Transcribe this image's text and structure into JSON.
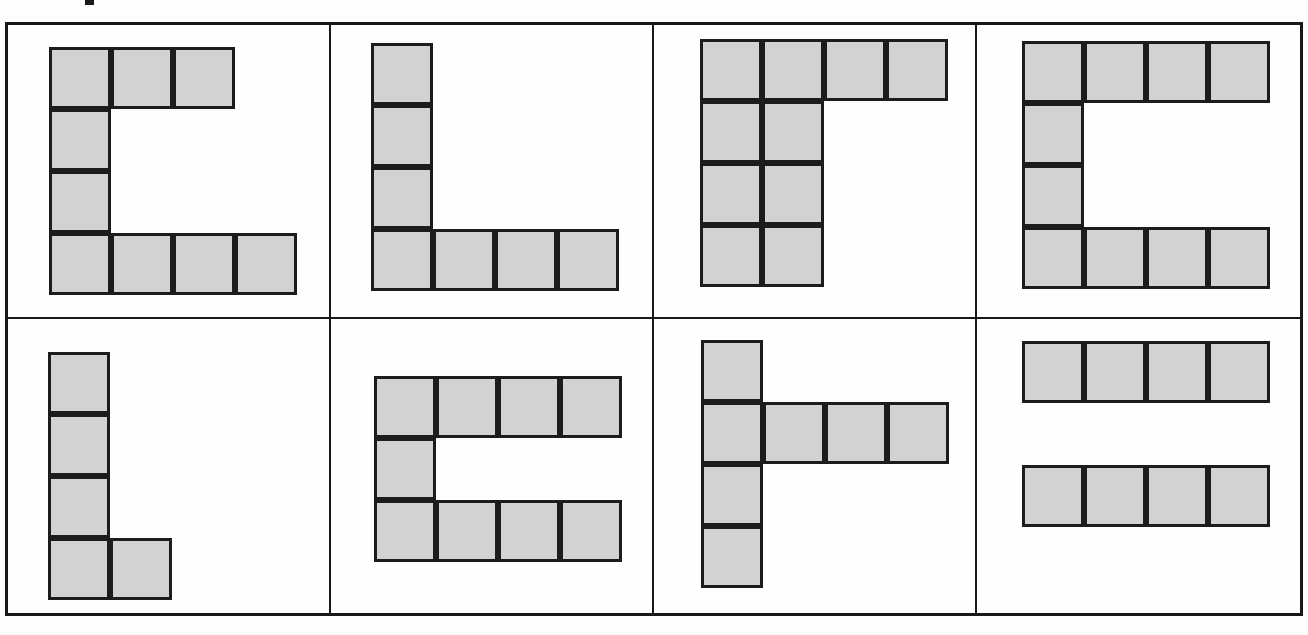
{
  "figure": {
    "kind": "polyomino-shape-grid",
    "columns": 4,
    "rows": 2,
    "cell_fill_color": "#d2d2d2",
    "cell_border_color": "#1c1c1c",
    "frame_border_color": "#181818",
    "background_color": "#fefefe",
    "square_size_px": 62,
    "marks": [
      {
        "name": "top-edge-ink-mark",
        "x": 85,
        "y": 0,
        "width": 9,
        "height": 5
      }
    ]
  },
  "panels": [
    {
      "index": 1,
      "name": "panel-1",
      "shape_name": "C-shape-tall-short-top",
      "offset_x": 41,
      "offset_y": 22,
      "cells": [
        [
          0,
          0
        ],
        [
          1,
          0
        ],
        [
          2,
          0
        ],
        [
          0,
          1
        ],
        [
          0,
          2
        ],
        [
          0,
          3
        ],
        [
          1,
          3
        ],
        [
          2,
          3
        ],
        [
          3,
          3
        ]
      ],
      "cell_count": 9
    },
    {
      "index": 2,
      "name": "panel-2",
      "shape_name": "L-shape-tall",
      "offset_x": 40,
      "offset_y": 18,
      "cells": [
        [
          0,
          0
        ],
        [
          0,
          1
        ],
        [
          0,
          2
        ],
        [
          0,
          3
        ],
        [
          1,
          3
        ],
        [
          2,
          3
        ],
        [
          3,
          3
        ]
      ],
      "cell_count": 7
    },
    {
      "index": 3,
      "name": "panel-3",
      "shape_name": "gamma-shape-wide-stem",
      "offset_x": 46,
      "offset_y": 14,
      "cells": [
        [
          0,
          0
        ],
        [
          1,
          0
        ],
        [
          2,
          0
        ],
        [
          3,
          0
        ],
        [
          0,
          1
        ],
        [
          1,
          1
        ],
        [
          0,
          2
        ],
        [
          1,
          2
        ],
        [
          0,
          3
        ],
        [
          1,
          3
        ]
      ],
      "cell_count": 10
    },
    {
      "index": 4,
      "name": "panel-4",
      "shape_name": "C-shape-full",
      "offset_x": 45,
      "offset_y": 16,
      "cells": [
        [
          0,
          0
        ],
        [
          1,
          0
        ],
        [
          2,
          0
        ],
        [
          3,
          0
        ],
        [
          0,
          1
        ],
        [
          0,
          2
        ],
        [
          0,
          3
        ],
        [
          1,
          3
        ],
        [
          2,
          3
        ],
        [
          3,
          3
        ]
      ],
      "cell_count": 10
    },
    {
      "index": 5,
      "name": "panel-5",
      "shape_name": "L-shape-small-foot",
      "offset_x": 40,
      "offset_y": 33,
      "cells": [
        [
          0,
          0
        ],
        [
          0,
          1
        ],
        [
          0,
          2
        ],
        [
          0,
          3
        ],
        [
          1,
          3
        ]
      ],
      "cell_count": 5
    },
    {
      "index": 6,
      "name": "panel-6",
      "shape_name": "C-shape-short",
      "offset_x": 43,
      "offset_y": 57,
      "cells": [
        [
          0,
          0
        ],
        [
          1,
          0
        ],
        [
          2,
          0
        ],
        [
          3,
          0
        ],
        [
          0,
          1
        ],
        [
          0,
          2
        ],
        [
          1,
          2
        ],
        [
          2,
          2
        ],
        [
          3,
          2
        ]
      ],
      "cell_count": 9
    },
    {
      "index": 7,
      "name": "panel-7",
      "shape_name": "T-rotated-left-stem",
      "offset_x": 47,
      "offset_y": 21,
      "cells": [
        [
          0,
          0
        ],
        [
          0,
          1
        ],
        [
          1,
          1
        ],
        [
          2,
          1
        ],
        [
          3,
          1
        ],
        [
          0,
          2
        ],
        [
          0,
          3
        ]
      ],
      "cell_count": 7
    },
    {
      "index": 8,
      "name": "panel-8",
      "shape_name": "two-separate-bars",
      "offset_x": 45,
      "offset_y": 22,
      "cells": [
        [
          0,
          0
        ],
        [
          1,
          0
        ],
        [
          2,
          0
        ],
        [
          3,
          0
        ],
        [
          0,
          2
        ],
        [
          1,
          2
        ],
        [
          2,
          2
        ],
        [
          3,
          2
        ]
      ],
      "cell_count": 8
    }
  ]
}
